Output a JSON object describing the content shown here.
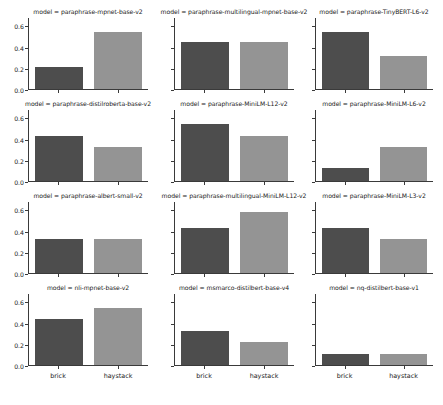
{
  "figure": {
    "type": "small-multiples-bar-grid",
    "n_rows": 4,
    "n_cols": 3,
    "background": "#ffffff"
  },
  "axis": {
    "y_ticks": [
      "0.0",
      "0.2",
      "0.4",
      "0.6"
    ],
    "y_tick_values": [
      0.0,
      0.2,
      0.4,
      0.6
    ],
    "ylim": [
      0.0,
      0.68
    ],
    "x_categories": [
      "brick",
      "haystack"
    ],
    "grid": false
  },
  "colors": {
    "bar_brick": "#4d4d4d",
    "bar_haystack": "#949494",
    "axis": "#3a3a3a",
    "text": "#1a1a1a"
  },
  "chart_data": {
    "type": "bar",
    "title": "",
    "subtitle": "",
    "xlabel": "",
    "ylabel": "",
    "categories": [
      "brick",
      "haystack"
    ],
    "ylim": [
      0.0,
      0.68
    ],
    "yticks": [
      0.0,
      0.2,
      0.4,
      0.6
    ],
    "grid": false,
    "legend": null,
    "facet_variable": "model",
    "panels": [
      {
        "title": "model = paraphrase-mpnet-base-v2",
        "facet_value": "paraphrase-mpnet-base-v2",
        "row": 0,
        "col": 0,
        "categories": [
          "brick",
          "haystack"
        ],
        "values": [
          0.21,
          0.55
        ]
      },
      {
        "title": "model = paraphrase-multilingual-mpnet-base-v2",
        "facet_value": "paraphrase-multilingual-mpnet-base-v2",
        "row": 0,
        "col": 1,
        "categories": [
          "brick",
          "haystack"
        ],
        "values": [
          0.45,
          0.45
        ]
      },
      {
        "title": "model = paraphrase-TinyBERT-L6-v2",
        "facet_value": "paraphrase-TinyBERT-L6-v2",
        "row": 0,
        "col": 2,
        "categories": [
          "brick",
          "haystack"
        ],
        "values": [
          0.55,
          0.32
        ]
      },
      {
        "title": "model = paraphrase-distilroberta-base-v2",
        "facet_value": "paraphrase-distilroberta-base-v2",
        "row": 1,
        "col": 0,
        "categories": [
          "brick",
          "haystack"
        ],
        "values": [
          0.43,
          0.33
        ]
      },
      {
        "title": "model = paraphrase-MiniLM-L12-v2",
        "facet_value": "paraphrase-MiniLM-L12-v2",
        "row": 1,
        "col": 1,
        "categories": [
          "brick",
          "haystack"
        ],
        "values": [
          0.55,
          0.43
        ]
      },
      {
        "title": "model = paraphrase-MiniLM-L6-v2",
        "facet_value": "paraphrase-MiniLM-L6-v2",
        "row": 1,
        "col": 2,
        "categories": [
          "brick",
          "haystack"
        ],
        "values": [
          0.12,
          0.33
        ]
      },
      {
        "title": "model = paraphrase-albert-small-v2",
        "facet_value": "paraphrase-albert-small-v2",
        "row": 2,
        "col": 0,
        "categories": [
          "brick",
          "haystack"
        ],
        "values": [
          0.33,
          0.33
        ]
      },
      {
        "title": "model = paraphrase-multilingual-MiniLM-L12-v2",
        "facet_value": "paraphrase-multilingual-MiniLM-L12-v2",
        "row": 2,
        "col": 1,
        "categories": [
          "brick",
          "haystack"
        ],
        "values": [
          0.43,
          0.58
        ]
      },
      {
        "title": "model = paraphrase-MiniLM-L3-v2",
        "facet_value": "paraphrase-MiniLM-L3-v2",
        "row": 2,
        "col": 2,
        "categories": [
          "brick",
          "haystack"
        ],
        "values": [
          0.43,
          0.33
        ]
      },
      {
        "title": "model = nli-mpnet-base-v2",
        "facet_value": "nli-mpnet-base-v2",
        "row": 3,
        "col": 0,
        "categories": [
          "brick",
          "haystack"
        ],
        "values": [
          0.44,
          0.55
        ]
      },
      {
        "title": "model = msmarco-distilbert-base-v4",
        "facet_value": "msmarco-distilbert-base-v4",
        "row": 3,
        "col": 1,
        "categories": [
          "brick",
          "haystack"
        ],
        "values": [
          0.33,
          0.22
        ]
      },
      {
        "title": "model = nq-distilbert-base-v1",
        "facet_value": "nq-distilbert-base-v1",
        "row": 3,
        "col": 2,
        "categories": [
          "brick",
          "haystack"
        ],
        "values": [
          0.11,
          0.11
        ]
      }
    ]
  }
}
